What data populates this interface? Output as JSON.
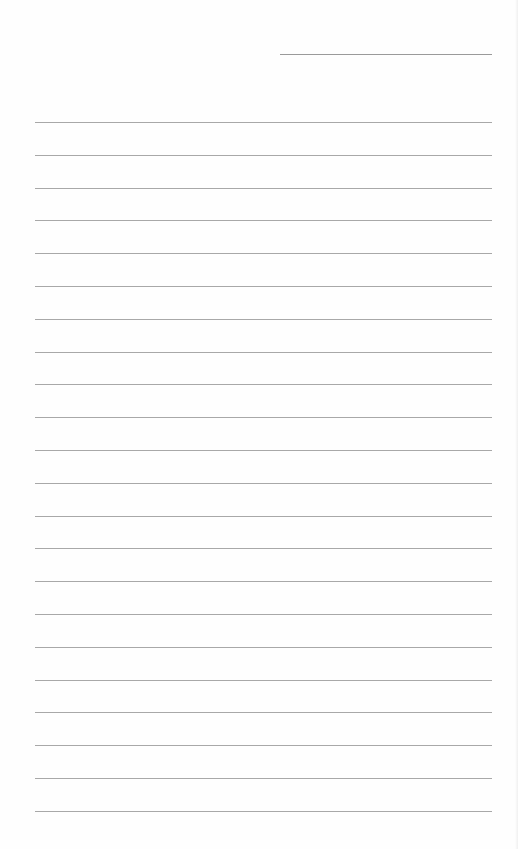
{
  "page": {
    "type": "lined-paper",
    "background_color": "#fefefe",
    "line_color": "#a8a8a8",
    "header_line": {
      "present": true
    },
    "ruled_lines": {
      "count": 22,
      "first_top": 122,
      "spacing": 32.8
    }
  }
}
